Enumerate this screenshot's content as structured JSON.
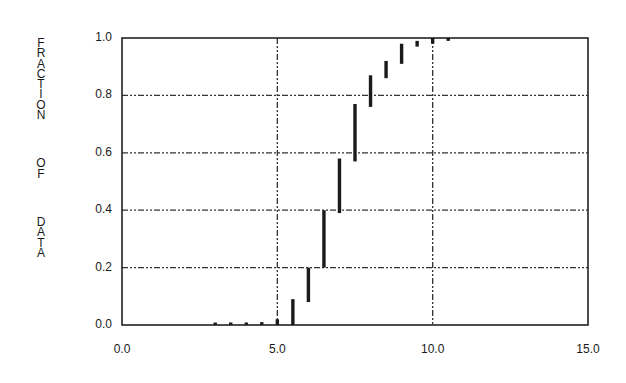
{
  "chart_data": {
    "type": "bar",
    "subtype": "range-bars (empirical CDF step segments)",
    "title": "",
    "xlabel": "",
    "ylabel": "FRACTION OF DATA",
    "ylabel_lines": [
      "FRACTION",
      "OF",
      "DATA"
    ],
    "xlim": [
      0.0,
      15.0
    ],
    "ylim": [
      0.0,
      1.0
    ],
    "x_ticks": [
      0.0,
      5.0,
      10.0,
      15.0
    ],
    "x_tick_labels": [
      "0.0",
      "5.0",
      "10.0",
      "15.0"
    ],
    "y_ticks": [
      0.0,
      0.2,
      0.4,
      0.6,
      0.8,
      1.0
    ],
    "y_tick_labels": [
      "0.0",
      "0.2",
      "0.4",
      "0.6",
      "0.8",
      "1.0"
    ],
    "grid": {
      "vertical": [
        5.0,
        10.0
      ],
      "horizontal": [
        0.2,
        0.4,
        0.6,
        0.8
      ],
      "style": "dash-dot"
    },
    "legend": null,
    "x": [
      3.0,
      3.5,
      4.0,
      4.5,
      5.0,
      5.5,
      6.0,
      6.5,
      7.0,
      7.5,
      8.0,
      8.5,
      9.0,
      9.5,
      10.0,
      10.5
    ],
    "series": [
      {
        "name": "fraction range",
        "low": [
          0.0,
          0.0,
          0.0,
          0.0,
          0.0,
          0.0,
          0.08,
          0.2,
          0.39,
          0.57,
          0.76,
          0.86,
          0.91,
          0.97,
          0.98,
          0.99
        ],
        "high": [
          0.003,
          0.003,
          0.003,
          0.01,
          0.02,
          0.09,
          0.2,
          0.4,
          0.58,
          0.77,
          0.87,
          0.92,
          0.98,
          0.99,
          1.0,
          1.0
        ]
      }
    ],
    "colors": {
      "bar": "#1a1a1a",
      "axis": "#222222",
      "grid": "#333333"
    }
  }
}
